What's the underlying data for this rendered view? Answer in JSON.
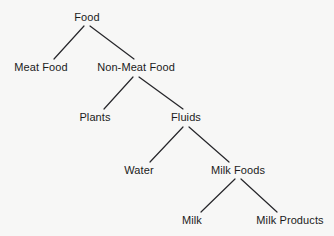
{
  "diagram": {
    "type": "tree-diagram",
    "background_color": "#f7f7f6",
    "edge_color": "#26262a",
    "text_color": "#1b1b1b",
    "canvas": {
      "width": 334,
      "height": 236
    },
    "nodes": [
      {
        "id": "food",
        "label": "Food",
        "cx": 87,
        "text_top": 12,
        "apex_y": 25,
        "level": 0
      },
      {
        "id": "meat-food",
        "label": "Meat Food",
        "cx": 41,
        "text_top": 62,
        "apex_y": 76,
        "level": 1
      },
      {
        "id": "non-meat-food",
        "label": "Non-Meat Food",
        "cx": 136,
        "text_top": 62,
        "apex_y": 76,
        "level": 1
      },
      {
        "id": "plants",
        "label": "Plants",
        "cx": 95,
        "text_top": 112,
        "apex_y": 126,
        "level": 2
      },
      {
        "id": "fluids",
        "label": "Fluids",
        "cx": 186,
        "text_top": 112,
        "apex_y": 126,
        "level": 2
      },
      {
        "id": "water",
        "label": "Water",
        "cx": 139,
        "text_top": 165,
        "apex_y": 178,
        "level": 3
      },
      {
        "id": "milk-foods",
        "label": "Milk Foods",
        "cx": 238,
        "text_top": 165,
        "apex_y": 178,
        "level": 3
      },
      {
        "id": "milk",
        "label": "Milk",
        "cx": 192,
        "text_top": 215,
        "apex_y": 228,
        "level": 4
      },
      {
        "id": "milk-products",
        "label": "Milk Products",
        "cx": 290,
        "text_top": 215,
        "apex_y": 228,
        "level": 4
      }
    ],
    "edges": [
      {
        "id": "edge-food-meat-food",
        "from": "food",
        "to": "meat-food",
        "x1": 84,
        "y1": 26,
        "x2": 54,
        "y2": 59
      },
      {
        "id": "edge-food-non-meat-food",
        "from": "food",
        "to": "non-meat-food",
        "x1": 90,
        "y1": 26,
        "x2": 134,
        "y2": 59
      },
      {
        "id": "edge-non-meat-food-plants",
        "from": "non-meat-food",
        "to": "plants",
        "x1": 133,
        "y1": 77,
        "x2": 104,
        "y2": 109
      },
      {
        "id": "edge-non-meat-food-fluids",
        "from": "non-meat-food",
        "to": "fluids",
        "x1": 139,
        "y1": 77,
        "x2": 183,
        "y2": 109
      },
      {
        "id": "edge-fluids-water",
        "from": "fluids",
        "to": "water",
        "x1": 183,
        "y1": 127,
        "x2": 150,
        "y2": 162
      },
      {
        "id": "edge-fluids-milk-foods",
        "from": "fluids",
        "to": "milk-foods",
        "x1": 189,
        "y1": 127,
        "x2": 229,
        "y2": 162
      },
      {
        "id": "edge-milk-foods-milk",
        "from": "milk-foods",
        "to": "milk",
        "x1": 235,
        "y1": 179,
        "x2": 201,
        "y2": 212
      },
      {
        "id": "edge-milk-foods-milk-products",
        "from": "milk-foods",
        "to": "milk-products",
        "x1": 241,
        "y1": 179,
        "x2": 277,
        "y2": 212
      }
    ]
  }
}
